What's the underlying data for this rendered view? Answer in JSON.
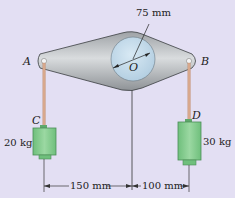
{
  "diagram": {
    "labels": {
      "A": "A",
      "B": "B",
      "C": "C",
      "D": "D",
      "O": "O"
    },
    "radius_label": "75 mm",
    "mass_C": "20 kg",
    "mass_D": "30 kg",
    "dim_left": "150 mm",
    "dim_right": "100 mm"
  },
  "colors": {
    "background": "#e3dff3",
    "plate": "#b8bcbf",
    "disk": "#c6dcec",
    "rope": "#d8a88c",
    "block": "#7fc98a"
  }
}
